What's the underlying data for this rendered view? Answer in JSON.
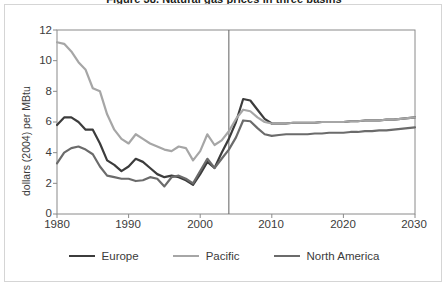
{
  "figure": {
    "title": "Figure 38. Natural gas prices in three basins",
    "outer_border_color": "#d5d5d5",
    "background": "#ffffff"
  },
  "chart_data": {
    "type": "line",
    "title": "Figure 38. Natural gas prices in three basins",
    "xlabel": "",
    "ylabel": "dollars (2004) per MBtu",
    "xlim": [
      1980,
      2030
    ],
    "ylim": [
      0,
      12
    ],
    "xticks": [
      1980,
      1990,
      2000,
      2010,
      2020,
      2030
    ],
    "yticks": [
      0,
      2,
      4,
      6,
      8,
      10,
      12
    ],
    "grid": false,
    "legend_position": "bottom",
    "history_projection_divider_x": 2004,
    "x": [
      1980,
      1981,
      1982,
      1983,
      1984,
      1985,
      1986,
      1987,
      1988,
      1989,
      1990,
      1991,
      1992,
      1993,
      1994,
      1995,
      1996,
      1997,
      1998,
      1999,
      2000,
      2001,
      2002,
      2003,
      2004,
      2005,
      2006,
      2007,
      2008,
      2009,
      2010,
      2011,
      2012,
      2013,
      2014,
      2015,
      2016,
      2017,
      2018,
      2019,
      2020,
      2021,
      2022,
      2023,
      2024,
      2025,
      2026,
      2027,
      2028,
      2029,
      2030
    ],
    "series": [
      {
        "name": "Europe",
        "color": "#3c3c3c",
        "width": 2.2,
        "values": [
          5.8,
          6.3,
          6.3,
          6.0,
          5.5,
          5.5,
          4.6,
          3.5,
          3.2,
          2.8,
          3.1,
          3.6,
          3.4,
          3.0,
          2.6,
          2.4,
          2.5,
          2.4,
          2.2,
          1.9,
          2.6,
          3.4,
          3.0,
          4.0,
          4.9,
          6.0,
          7.5,
          7.4,
          6.8,
          6.2,
          5.9,
          5.9,
          5.9,
          5.95,
          5.95,
          5.95,
          5.95,
          6.0,
          6.0,
          6.0,
          6.0,
          6.05,
          6.05,
          6.1,
          6.1,
          6.1,
          6.15,
          6.15,
          6.2,
          6.25,
          6.3
        ]
      },
      {
        "name": "Pacific",
        "color": "#a6a6a6",
        "width": 2.2,
        "values": [
          11.2,
          11.1,
          10.6,
          9.9,
          9.4,
          8.2,
          8.0,
          6.5,
          5.5,
          4.9,
          4.6,
          5.2,
          4.9,
          4.6,
          4.4,
          4.2,
          4.1,
          4.4,
          4.3,
          3.5,
          4.1,
          5.2,
          4.5,
          4.8,
          5.4,
          6.2,
          6.8,
          6.7,
          6.3,
          6.0,
          5.9,
          5.9,
          5.9,
          5.95,
          5.95,
          5.95,
          5.95,
          6.0,
          6.0,
          6.0,
          6.0,
          6.05,
          6.05,
          6.1,
          6.1,
          6.1,
          6.15,
          6.15,
          6.2,
          6.25,
          6.3
        ]
      },
      {
        "name": "North America",
        "color": "#6b6b6b",
        "width": 2.2,
        "values": [
          3.3,
          4.0,
          4.3,
          4.4,
          4.2,
          3.9,
          3.1,
          2.5,
          2.4,
          2.3,
          2.3,
          2.15,
          2.2,
          2.4,
          2.3,
          1.8,
          2.4,
          2.5,
          2.3,
          2.0,
          2.8,
          3.6,
          3.0,
          3.6,
          4.2,
          5.0,
          6.1,
          6.05,
          5.6,
          5.2,
          5.1,
          5.15,
          5.2,
          5.2,
          5.2,
          5.2,
          5.25,
          5.25,
          5.3,
          5.3,
          5.3,
          5.35,
          5.35,
          5.4,
          5.4,
          5.45,
          5.45,
          5.5,
          5.55,
          5.6,
          5.65
        ]
      }
    ]
  },
  "axis": {
    "y_title": "dollars (2004) per MBtu",
    "y_ticks": [
      "12",
      "10",
      "8",
      "6",
      "4",
      "2",
      "0"
    ],
    "x_ticks": [
      "1980",
      "1990",
      "2000",
      "2010",
      "2020",
      "2030"
    ]
  },
  "legend": {
    "items": [
      {
        "label": "Europe",
        "color": "#3c3c3c"
      },
      {
        "label": "Pacific",
        "color": "#a6a6a6"
      },
      {
        "label": "North America",
        "color": "#6b6b6b"
      }
    ]
  }
}
